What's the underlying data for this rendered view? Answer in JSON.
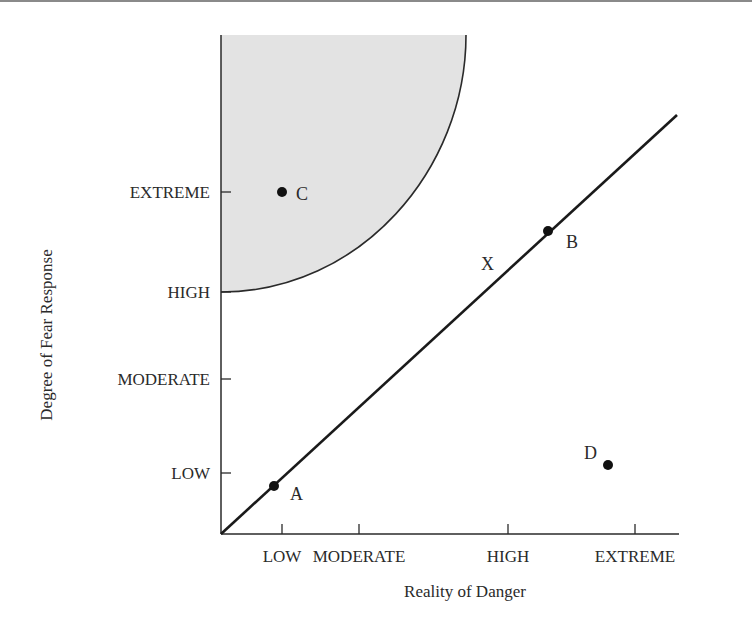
{
  "chart_data": {
    "type": "scatter",
    "title": "",
    "xlabel": "Reality of Danger",
    "ylabel": "Degree of Fear Response",
    "x_ticks": [
      {
        "label": "LOW",
        "value": 1
      },
      {
        "label": "MODERATE",
        "value": 2
      },
      {
        "label": "HIGH",
        "value": 4
      },
      {
        "label": "EXTREME",
        "value": 5.7
      }
    ],
    "y_ticks": [
      {
        "label": "LOW",
        "value": 1
      },
      {
        "label": "MODERATE",
        "value": 2
      },
      {
        "label": "HIGH",
        "value": 3
      },
      {
        "label": "EXTREME",
        "value": 4
      }
    ],
    "xlim": [
      0.2,
      6.2
    ],
    "ylim": [
      0,
      5.5
    ],
    "grid": false,
    "line": {
      "label": "X",
      "from": [
        0.2,
        0
      ],
      "to": [
        6.17,
        4.5
      ]
    },
    "shaded_region": {
      "description": "quarter-circle region of irrational fear (high fear, low danger)",
      "x_extent": [
        0.2,
        3.4
      ],
      "y_extent": [
        3.0,
        5.4
      ],
      "color": "#e3e3e3"
    },
    "points": [
      {
        "label": "A",
        "x": 0.9,
        "y": 0.85
      },
      {
        "label": "B",
        "x": 4.5,
        "y": 3.6
      },
      {
        "label": "C",
        "x": 1.0,
        "y": 4.0
      },
      {
        "label": "D",
        "x": 5.3,
        "y": 0.9
      }
    ],
    "line_label": "X"
  }
}
